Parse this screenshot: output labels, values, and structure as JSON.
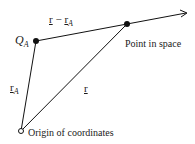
{
  "diagram": {
    "type": "vector-diagram",
    "points": {
      "q_a": {
        "label_main": "Q",
        "label_sub": "A",
        "x": 36,
        "y": 41
      },
      "point_in_space": {
        "label": "Point in space",
        "x": 127,
        "y": 24
      },
      "origin": {
        "label": "Origin of coordinates",
        "x": 21,
        "y": 131
      }
    },
    "vectors": {
      "r_minus_ra": {
        "r": "r",
        "minus": " − ",
        "ra": "r",
        "sub": "A"
      },
      "r_a": {
        "r": "r",
        "sub": "A"
      },
      "r": {
        "r": "r"
      }
    },
    "colors": {
      "line": "#111111",
      "text": "#1a1a1a"
    }
  }
}
